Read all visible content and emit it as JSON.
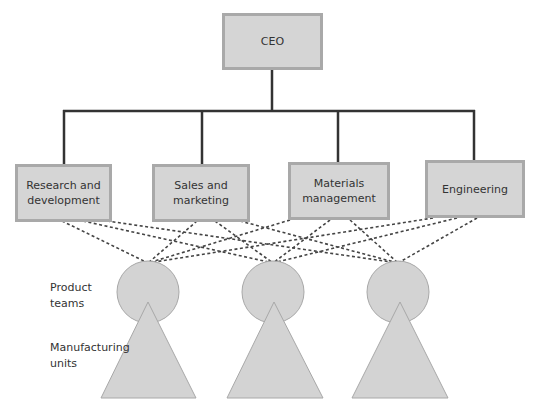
{
  "chart": {
    "top": {
      "label": "CEO"
    },
    "departments": [
      {
        "label": "Research and development"
      },
      {
        "label": "Sales and marketing"
      },
      {
        "label": "Materials management"
      },
      {
        "label": "Engineering"
      }
    ],
    "legend": {
      "product_teams": "Product teams",
      "manufacturing_units": "Manufacturing units"
    },
    "colors": {
      "box_fill": "#d5d5d5",
      "box_border": "#a9a9a9",
      "line": "#333333",
      "shape_fill": "#d3d3d3",
      "shape_stroke": "#a8a8a8"
    }
  }
}
